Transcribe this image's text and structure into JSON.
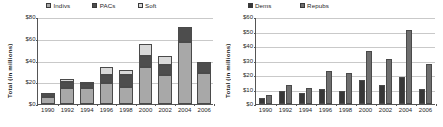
{
  "charts": [
    {
      "id": "left",
      "ylabel": "Total (in millions)",
      "legend": [
        {
          "name": "Indivs",
          "color": "#a8a8a8"
        },
        {
          "name": "PACs",
          "color": "#4d4d4d"
        },
        {
          "name": "Soft",
          "color": "#d9d9d9"
        }
      ],
      "yticks": [
        "$0",
        "$20",
        "$40",
        "$60",
        "$80"
      ],
      "ytick_values": [
        0,
        20,
        40,
        60,
        80
      ],
      "xticks": [
        "1990",
        "1992",
        "1994",
        "1996",
        "1998",
        "2000",
        "2002",
        "2004",
        "2006"
      ]
    },
    {
      "id": "right",
      "ylabel": "Total (in millions)",
      "legend": [
        {
          "name": "Dems",
          "color": "#383838"
        },
        {
          "name": "Repubs",
          "color": "#6e6e6e"
        }
      ],
      "yticks": [
        "$0",
        "$10",
        "$20",
        "$30",
        "$40",
        "$50",
        "$60"
      ],
      "ytick_values": [
        0,
        10,
        20,
        30,
        40,
        50,
        60
      ],
      "xticks": [
        "1990",
        "1992",
        "1994",
        "1996",
        "1998",
        "2000",
        "2002",
        "2004",
        "2006"
      ]
    }
  ],
  "chart_data": [
    {
      "type": "bar",
      "stacked": true,
      "title": "",
      "xlabel": "",
      "ylabel": "Total (in millions)",
      "ylim": [
        0,
        80
      ],
      "grid": true,
      "legend_position": "top",
      "categories": [
        "1990",
        "1992",
        "1994",
        "1996",
        "1998",
        "2000",
        "2002",
        "2004",
        "2006"
      ],
      "series": [
        {
          "name": "Indivs",
          "color": "#a8a8a8",
          "values": [
            7.0,
            15.5,
            15.0,
            20.0,
            16.5,
            35.0,
            27.5,
            57.5,
            29.0
          ]
        },
        {
          "name": "PACs",
          "color": "#4d4d4d",
          "values": [
            4.5,
            5.5,
            4.5,
            7.0,
            11.0,
            9.5,
            9.0,
            14.0,
            10.5
          ]
        },
        {
          "name": "Soft",
          "color": "#d9d9d9",
          "values": [
            0.0,
            3.0,
            1.5,
            7.5,
            4.5,
            11.5,
            8.5,
            0.0,
            0.0
          ]
        }
      ],
      "totals": [
        11.5,
        24.0,
        21.0,
        34.5,
        32.0,
        56.0,
        45.0,
        71.5,
        39.5
      ]
    },
    {
      "type": "bar",
      "stacked": false,
      "title": "",
      "xlabel": "",
      "ylabel": "Total (in millions)",
      "ylim": [
        0,
        60
      ],
      "grid": true,
      "legend_position": "top",
      "categories": [
        "1990",
        "1992",
        "1994",
        "1996",
        "1998",
        "2000",
        "2002",
        "2004",
        "2006"
      ],
      "series": [
        {
          "name": "Dems",
          "color": "#383838",
          "values": [
            4.5,
            9.5,
            8.5,
            11.0,
            10.0,
            17.0,
            13.5,
            19.5,
            11.0
          ]
        },
        {
          "name": "Repubs",
          "color": "#6e6e6e",
          "values": [
            7.0,
            14.0,
            12.0,
            23.5,
            22.0,
            37.5,
            31.5,
            51.5,
            28.5
          ]
        }
      ]
    }
  ]
}
